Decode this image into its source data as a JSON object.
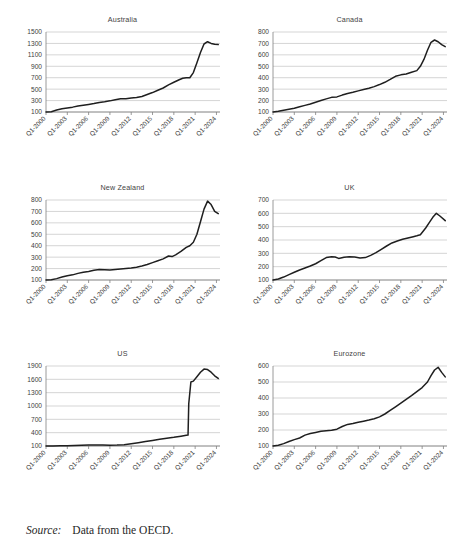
{
  "figure": {
    "source_label": "Source:",
    "source_text": "Data from the OECD.",
    "line_color": "#1f1f1f",
    "grid_color": "#b9b9b9",
    "axis_color": "#808080",
    "text_color": "#404040"
  },
  "chart_data": [
    {
      "type": "line",
      "title": "Australia",
      "xlabel": "",
      "ylabel": "",
      "grid": true,
      "legend": false,
      "ylim": [
        100,
        1500
      ],
      "yticks": [
        100,
        300,
        500,
        700,
        900,
        1100,
        1300,
        1500
      ],
      "xticks": [
        "Q1-2000",
        "Q1-2003",
        "Q1-2006",
        "Q1-2009",
        "Q1-2012",
        "Q1-2015",
        "Q1-2018",
        "Q1-2021",
        "Q1-2024"
      ],
      "x": [
        2000,
        2000.75,
        2001.5,
        2002.25,
        2003,
        2003.75,
        2004.5,
        2005.25,
        2006,
        2006.75,
        2007.5,
        2008.25,
        2009,
        2009.75,
        2010.5,
        2011.25,
        2012,
        2012.75,
        2013.5,
        2014.25,
        2015,
        2015.75,
        2016.5,
        2017.25,
        2018,
        2018.75,
        2019.25,
        2019.75,
        2020.25,
        2020.75,
        2021.25,
        2021.75,
        2022.25,
        2022.75,
        2023.25,
        2023.75,
        2024.25
      ],
      "values": [
        100,
        106,
        135,
        158,
        172,
        185,
        205,
        218,
        232,
        248,
        268,
        280,
        295,
        315,
        330,
        332,
        345,
        352,
        372,
        405,
        440,
        480,
        520,
        575,
        620,
        665,
        690,
        700,
        700,
        790,
        960,
        1140,
        1290,
        1330,
        1300,
        1285,
        1280
      ]
    },
    {
      "type": "line",
      "title": "Canada",
      "xlabel": "",
      "ylabel": "",
      "grid": true,
      "legend": false,
      "ylim": [
        100,
        800
      ],
      "yticks": [
        100,
        200,
        300,
        400,
        500,
        600,
        700,
        800
      ],
      "xticks": [
        "Q1-2000",
        "Q1-2003",
        "Q1-2006",
        "Q1-2009",
        "Q1-2012",
        "Q1-2015",
        "Q1-2018",
        "Q1-2021",
        "Q1-2024"
      ],
      "x": [
        2000,
        2000.75,
        2001.5,
        2002.25,
        2003,
        2003.75,
        2004.5,
        2005.25,
        2006,
        2006.75,
        2007.5,
        2008.25,
        2009,
        2009.75,
        2010.5,
        2011.25,
        2012,
        2012.75,
        2013.5,
        2014.25,
        2015,
        2015.75,
        2016.5,
        2017.25,
        2018,
        2018.75,
        2019.5,
        2020.25,
        2020.75,
        2021.25,
        2021.75,
        2022.25,
        2022.75,
        2023.25,
        2023.75,
        2024.25
      ],
      "values": [
        100,
        106,
        116,
        124,
        133,
        146,
        158,
        170,
        185,
        200,
        215,
        228,
        232,
        248,
        262,
        272,
        285,
        296,
        308,
        322,
        340,
        360,
        385,
        412,
        425,
        432,
        448,
        462,
        500,
        560,
        640,
        710,
        730,
        715,
        690,
        672
      ]
    },
    {
      "type": "line",
      "title": "New Zealand",
      "xlabel": "",
      "ylabel": "",
      "grid": true,
      "legend": false,
      "ylim": [
        100,
        800
      ],
      "yticks": [
        100,
        200,
        300,
        400,
        500,
        600,
        700,
        800
      ],
      "xticks": [
        "Q1-2000",
        "Q1-2003",
        "Q1-2006",
        "Q1-2009",
        "Q1-2012",
        "Q1-2015",
        "Q1-2018",
        "Q1-2021",
        "Q1-2024"
      ],
      "x": [
        2000,
        2000.75,
        2001.5,
        2002.25,
        2003,
        2003.75,
        2004.5,
        2005.25,
        2006,
        2006.75,
        2007.5,
        2008.25,
        2009,
        2009.75,
        2010.5,
        2011.25,
        2012,
        2012.75,
        2013.5,
        2014.25,
        2015,
        2015.75,
        2016.5,
        2017.25,
        2017.75,
        2018.25,
        2019,
        2019.75,
        2020.25,
        2020.75,
        2021.25,
        2021.75,
        2022.25,
        2022.75,
        2023.25,
        2023.75,
        2024.25
      ],
      "values": [
        100,
        103,
        112,
        126,
        138,
        145,
        158,
        168,
        175,
        185,
        192,
        190,
        188,
        192,
        196,
        200,
        205,
        212,
        222,
        235,
        252,
        268,
        285,
        310,
        305,
        320,
        350,
        385,
        400,
        430,
        500,
        610,
        720,
        790,
        760,
        700,
        680
      ]
    },
    {
      "type": "line",
      "title": "UK",
      "xlabel": "",
      "ylabel": "",
      "grid": true,
      "legend": false,
      "ylim": [
        100,
        700
      ],
      "yticks": [
        100,
        200,
        300,
        400,
        500,
        600,
        700
      ],
      "xticks": [
        "Q1-2000",
        "Q1-2003",
        "Q1-2006",
        "Q1-2009",
        "Q1-2012",
        "Q1-2015",
        "Q1-2018",
        "Q1-2021",
        "Q1-2024"
      ],
      "x": [
        2000,
        2000.75,
        2001.5,
        2002.25,
        2003,
        2003.75,
        2004.5,
        2005.25,
        2006,
        2006.75,
        2007.5,
        2008.25,
        2008.75,
        2009.25,
        2010,
        2010.75,
        2011.5,
        2012.25,
        2013,
        2013.75,
        2014.5,
        2015.25,
        2016,
        2016.75,
        2017.5,
        2018.25,
        2019,
        2019.75,
        2020.25,
        2020.75,
        2021.5,
        2022,
        2022.5,
        2023,
        2023.5,
        2024.25
      ],
      "values": [
        100,
        108,
        122,
        140,
        158,
        175,
        190,
        205,
        222,
        245,
        268,
        275,
        272,
        262,
        270,
        275,
        272,
        265,
        268,
        285,
        305,
        330,
        355,
        378,
        392,
        405,
        415,
        425,
        432,
        440,
        490,
        530,
        570,
        600,
        580,
        545
      ]
    },
    {
      "type": "line",
      "title": "US",
      "xlabel": "",
      "ylabel": "",
      "grid": true,
      "legend": false,
      "ylim": [
        100,
        1900
      ],
      "yticks": [
        100,
        400,
        700,
        1000,
        1300,
        1600,
        1900
      ],
      "xticks": [
        "Q1-2000",
        "Q1-2003",
        "Q1-2006",
        "Q1-2009",
        "Q1-2012",
        "Q1-2015",
        "Q1-2018",
        "Q1-2021",
        "Q1-2024"
      ],
      "x": [
        2000,
        2001,
        2002,
        2003,
        2004,
        2005,
        2006,
        2007,
        2008,
        2009,
        2010,
        2011,
        2012,
        2013,
        2014,
        2015,
        2016,
        2017,
        2018,
        2019,
        2019.75,
        2020,
        2020.1,
        2020.4,
        2020.75,
        2021.25,
        2021.75,
        2022.25,
        2022.75,
        2023.25,
        2023.75,
        2024.25
      ],
      "values": [
        100,
        102,
        104,
        107,
        110,
        115,
        120,
        122,
        120,
        118,
        120,
        128,
        150,
        175,
        200,
        225,
        250,
        275,
        295,
        320,
        340,
        345,
        1050,
        1540,
        1560,
        1660,
        1760,
        1830,
        1820,
        1760,
        1680,
        1620
      ]
    },
    {
      "type": "line",
      "title": "Eurozone",
      "xlabel": "",
      "ylabel": "",
      "grid": true,
      "legend": false,
      "ylim": [
        100,
        600
      ],
      "yticks": [
        100,
        200,
        300,
        400,
        500,
        600
      ],
      "xticks": [
        "Q1-2000",
        "Q1-2003",
        "Q1-2006",
        "Q1-2009",
        "Q1-2012",
        "Q1-2015",
        "Q1-2018",
        "Q1-2021",
        "Q1-2024"
      ],
      "x": [
        2000,
        2000.75,
        2001.5,
        2002.25,
        2003,
        2003.75,
        2004.5,
        2005.25,
        2006,
        2006.75,
        2007.5,
        2008.25,
        2009,
        2009.75,
        2010.5,
        2011.25,
        2012,
        2012.75,
        2013.5,
        2014.25,
        2015,
        2015.75,
        2016.5,
        2017.25,
        2018,
        2018.75,
        2019.5,
        2020.25,
        2021,
        2021.75,
        2022.25,
        2022.75,
        2023.25,
        2023.75,
        2024.25
      ],
      "values": [
        100,
        105,
        115,
        128,
        140,
        150,
        168,
        178,
        185,
        192,
        196,
        198,
        205,
        222,
        235,
        240,
        248,
        255,
        262,
        270,
        282,
        300,
        322,
        345,
        368,
        392,
        415,
        440,
        465,
        500,
        540,
        575,
        592,
        560,
        532
      ]
    }
  ]
}
